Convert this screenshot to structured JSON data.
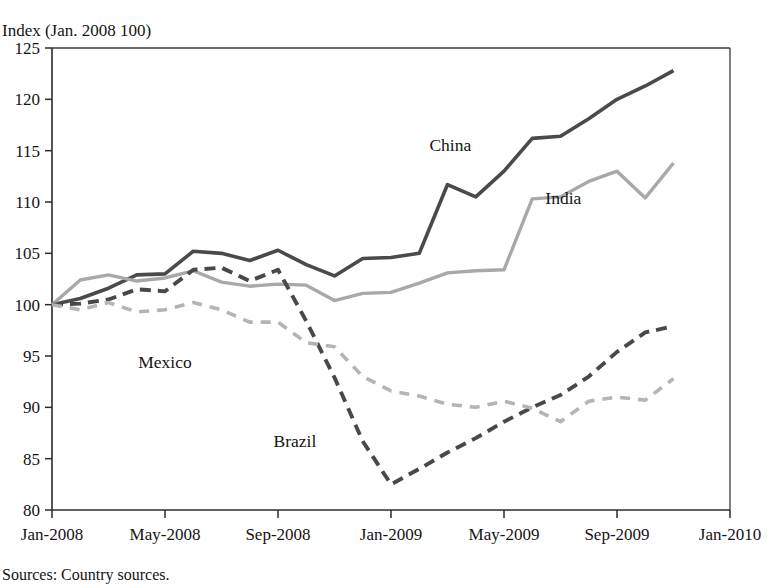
{
  "chart_data": {
    "type": "line",
    "title": "",
    "ylabel": "Index (Jan. 2008   100)",
    "xlabel": "",
    "ylim": [
      80,
      125
    ],
    "yticks": [
      80,
      85,
      90,
      95,
      100,
      105,
      110,
      115,
      120,
      125
    ],
    "ytick_labels": [
      "80",
      "85",
      "90",
      "95",
      "100",
      "105",
      "110",
      "115",
      "120",
      "125"
    ],
    "xlim": [
      0,
      24
    ],
    "xticks": [
      0,
      4,
      8,
      12,
      16,
      20,
      24
    ],
    "xtick_labels": [
      "Jan-2008",
      "May-2008",
      "Sep-2008",
      "Jan-2009",
      "May-2009",
      "Sep-2009",
      "Jan-2010"
    ],
    "grid": false,
    "legend_position": "inline-annotations",
    "x": [
      0,
      1,
      2,
      3,
      4,
      5,
      6,
      7,
      8,
      9,
      10,
      11,
      12,
      13,
      14,
      15,
      16,
      17,
      18,
      19,
      20,
      21,
      22
    ],
    "series": [
      {
        "name": "China",
        "color": "#4a4a4a",
        "style": "solid",
        "width": 3.6,
        "label_x": 14.1,
        "label_y": 115.6,
        "values": [
          100.0,
          100.6,
          101.6,
          102.9,
          103.0,
          105.2,
          105.0,
          104.3,
          105.3,
          103.9,
          102.8,
          104.5,
          104.6,
          105.0,
          111.7,
          110.5,
          113.0,
          116.2,
          116.4,
          118.1,
          120.0,
          121.3,
          122.8
        ]
      },
      {
        "name": "India",
        "color": "#a8a8a8",
        "style": "solid",
        "width": 3.4,
        "label_x": 18.1,
        "label_y": 110.4,
        "values": [
          100.0,
          102.4,
          102.9,
          102.3,
          102.6,
          103.3,
          102.2,
          101.8,
          102.0,
          101.9,
          100.4,
          101.1,
          101.2,
          102.1,
          103.1,
          103.3,
          103.4,
          110.3,
          110.5,
          112.0,
          113.0,
          110.4,
          113.8
        ]
      },
      {
        "name": "Brazil",
        "color": "#484848",
        "style": "dashed",
        "width": 3.9,
        "dash": "11,7",
        "label_x": 8.6,
        "label_y": 86.7,
        "values": [
          100.0,
          100.1,
          100.5,
          101.5,
          101.3,
          103.4,
          103.6,
          102.3,
          103.4,
          98.4,
          92.9,
          86.7,
          82.5,
          84.0,
          85.6,
          87.0,
          88.6,
          90.0,
          91.2,
          93.0,
          95.4,
          97.3,
          97.9
        ]
      },
      {
        "name": "Mexico",
        "color": "#b4b4b4",
        "style": "dashed",
        "width": 3.6,
        "dash": "10,8",
        "label_x": 4.0,
        "label_y": 94.4,
        "values": [
          100.0,
          99.5,
          100.2,
          99.3,
          99.5,
          100.2,
          99.5,
          98.3,
          98.3,
          96.3,
          95.9,
          93.0,
          91.6,
          91.1,
          90.3,
          90.0,
          90.6,
          89.9,
          88.6,
          90.6,
          91.0,
          90.7,
          92.8
        ]
      }
    ],
    "source_note": "Sources: Country sources."
  }
}
